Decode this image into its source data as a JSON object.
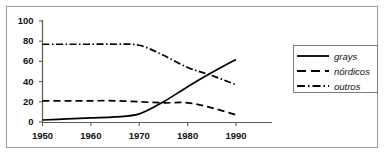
{
  "chart_data": {
    "type": "line",
    "title": "",
    "xlabel": "",
    "ylabel": "",
    "xlim": [
      1948,
      1992
    ],
    "ylim": [
      0,
      100
    ],
    "grid": false,
    "legend_position": "right",
    "x_ticks": [
      "1950",
      "1960",
      "1970",
      "1980",
      "1990"
    ],
    "y_ticks": [
      "0",
      "20",
      "40",
      "60",
      "80",
      "100"
    ],
    "x": [
      1950,
      1955,
      1960,
      1965,
      1970,
      1975,
      1980,
      1985,
      1990
    ],
    "series": [
      {
        "name": "grays",
        "style": "solid",
        "color": "#000000",
        "values": [
          2,
          3,
          4,
          5,
          8,
          20,
          35,
          49,
          62
        ]
      },
      {
        "name": "nórdicos",
        "style": "dashed",
        "color": "#000000",
        "values": [
          21,
          21,
          21,
          21,
          20,
          19,
          19,
          14,
          7
        ]
      },
      {
        "name": "outros",
        "style": "dashdot",
        "color": "#000000",
        "values": [
          77,
          77,
          77,
          77,
          76,
          66,
          54,
          46,
          37
        ]
      }
    ]
  },
  "legend": {
    "items": [
      {
        "label": "grays",
        "style": "solid"
      },
      {
        "label": "nórdicos",
        "style": "dashed"
      },
      {
        "label": "outros",
        "style": "dashdot"
      }
    ]
  },
  "axes": {
    "y_labels": [
      "100",
      "80",
      "60",
      "40",
      "20",
      "0"
    ],
    "x_labels": [
      "1950",
      "1960",
      "1970",
      "1980",
      "1990"
    ]
  },
  "colors": {
    "line": "#000000",
    "axis": "#5a5a5a",
    "border": "#9b9b9b",
    "background": "#ffffff"
  }
}
